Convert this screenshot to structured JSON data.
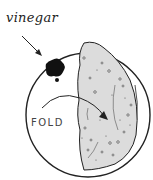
{
  "diagram": {
    "labels": {
      "vinegar": "vinegar",
      "fold": "FOLD"
    },
    "colors": {
      "stroke": "#222222",
      "fill": "#dddddd",
      "blot": "#111111"
    }
  }
}
